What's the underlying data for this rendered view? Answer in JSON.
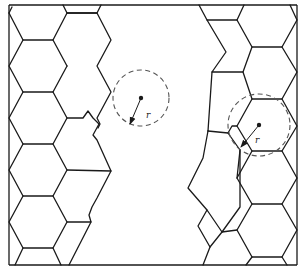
{
  "figure": {
    "type": "grain-structure-diagram",
    "colors": {
      "line": "#1a1a1a",
      "dashed_circle": "#555555",
      "background": "#ffffff"
    },
    "circles": [
      {
        "id": "amorphous-region-circle",
        "cx": 141,
        "cy": 98,
        "r": 28,
        "radius_label": "r"
      },
      {
        "id": "grain-circle",
        "cx": 259,
        "cy": 125,
        "r": 31,
        "radius_label": "r"
      }
    ]
  }
}
